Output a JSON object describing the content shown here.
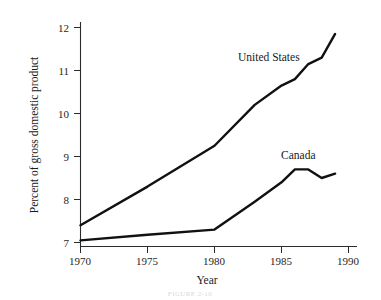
{
  "chart_data": {
    "type": "line",
    "title": "",
    "xlabel": "Year",
    "ylabel": "Percent of gross domestic product",
    "xlim": [
      1970,
      1990
    ],
    "ylim": [
      6.8,
      12.2
    ],
    "xticks": [
      1970,
      1975,
      1980,
      1985,
      1990
    ],
    "yticks": [
      7,
      8,
      9,
      10,
      11,
      12
    ],
    "xtick_labels": [
      "1970",
      "1975",
      "1980",
      "1985",
      "1990"
    ],
    "ytick_labels": [
      "7",
      "8",
      "9",
      "10",
      "11",
      "12"
    ],
    "grid": false,
    "legend_position": "inline-annotations",
    "series": [
      {
        "name": "United States",
        "color": "#111111",
        "x": [
          1970,
          1975,
          1980,
          1983,
          1985,
          1986,
          1987,
          1988,
          1989
        ],
        "values": [
          7.4,
          8.3,
          9.25,
          10.2,
          10.65,
          10.8,
          11.15,
          11.3,
          11.85
        ]
      },
      {
        "name": "Canada",
        "color": "#111111",
        "x": [
          1970,
          1975,
          1980,
          1983,
          1985,
          1986,
          1987,
          1988,
          1989
        ],
        "values": [
          7.05,
          7.18,
          7.3,
          7.95,
          8.4,
          8.7,
          8.7,
          8.5,
          8.6
        ]
      }
    ],
    "annotations": [
      {
        "text": "United States",
        "x": 1981.9,
        "y": 11.25
      },
      {
        "text": "Canada",
        "x": 1985.1,
        "y": 8.95
      }
    ]
  },
  "figure": {
    "caption": "FIGURE 2-10"
  }
}
